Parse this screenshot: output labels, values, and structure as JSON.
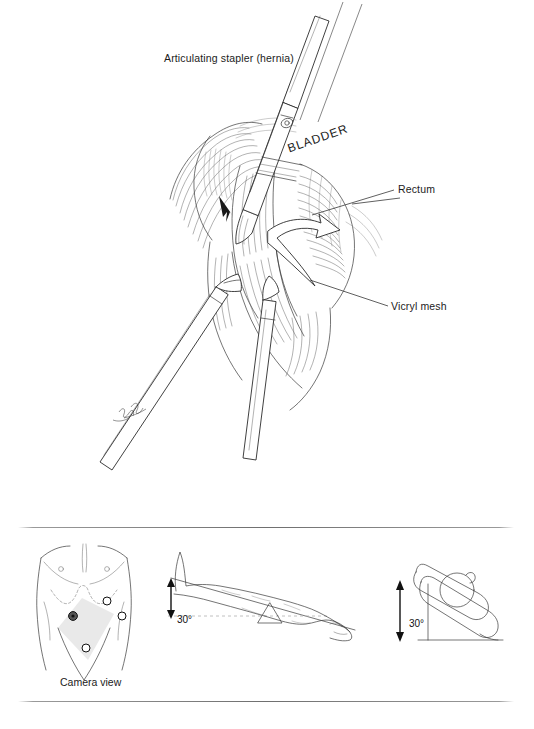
{
  "figure": {
    "type": "surgical-technique-illustration",
    "background_color": "#ffffff",
    "ink_color": "#2a2a2a"
  },
  "main_illustration": {
    "name": "laparoscopic-pelvic-dissection-view",
    "description": "Pen-and-ink operative view of the pelvis with an articulating stapler, rectum and Vicryl mesh",
    "labels": {
      "articulating_stapler": "Articulating stapler (hernia)",
      "bladder": "BLADDER",
      "rectum": "Rectum",
      "vicryl_mesh": "Vicryl mesh"
    },
    "instruments": [
      {
        "name": "articulating-stapler",
        "entry": "upper-right"
      },
      {
        "name": "grasper-lower-left",
        "entry": "lower-left"
      },
      {
        "name": "grasper-lower-right",
        "entry": "lower-right"
      }
    ],
    "annotations": [
      {
        "name": "retraction-arrow",
        "style": "hollow-curved-arrow"
      },
      {
        "name": "small-pointer-arrow",
        "style": "solid-small-arrow"
      }
    ],
    "signature": "artist signature on lower-left instrument shaft"
  },
  "bottom_panel": {
    "name": "setup-diagrams",
    "diagrams": [
      {
        "name": "port-placement-torso",
        "caption": "Camera view",
        "ports": [
          {
            "name": "camera-port",
            "filled": true
          },
          {
            "name": "working-port-upper",
            "filled": false
          },
          {
            "name": "working-port-right",
            "filled": false
          },
          {
            "name": "working-port-lower",
            "filled": false
          }
        ],
        "shaded_region": "camera-view-cone"
      },
      {
        "name": "patient-position-supine-trendelenburg",
        "angle_label": "30°",
        "angle_value": 30,
        "fulcrum": "table-break-triangle"
      },
      {
        "name": "patient-position-lateral-wedge",
        "angle_label": "30°",
        "angle_value": 30
      }
    ]
  },
  "dividers": [
    {
      "name": "divider-top"
    },
    {
      "name": "divider-bottom"
    }
  ]
}
